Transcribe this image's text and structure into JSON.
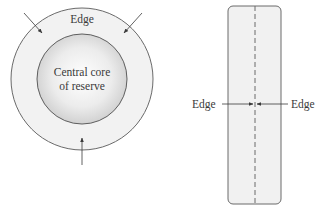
{
  "left_diagram": {
    "outer_label": "Edge",
    "core_label_line1": "Central core",
    "core_label_line2": "of reserve"
  },
  "right_diagram": {
    "left_label": "Edge",
    "right_label": "Edge"
  },
  "colors": {
    "stroke": "#6a6a6a",
    "ring_fill": "#f2f2f2",
    "core_center": "#ffffff",
    "core_edge": "#cfcfcf",
    "rect_fill": "#f1f1f1",
    "text": "#3a3a3a"
  }
}
